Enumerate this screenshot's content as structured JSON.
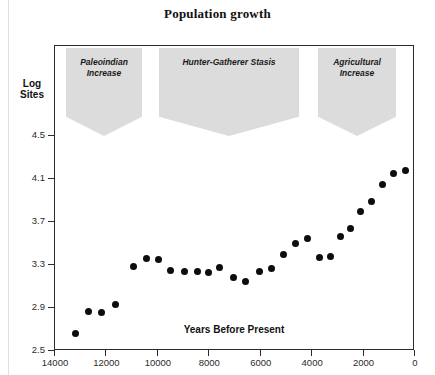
{
  "chart_data": {
    "type": "scatter",
    "title": "Population growth",
    "xlabel": "Years Before Present",
    "ylabel": "Log Sites",
    "xlim": [
      14000,
      0
    ],
    "ylim": [
      2.5,
      4.7
    ],
    "x_reversed": true,
    "grid": false,
    "legend": null,
    "xticks": [
      14000,
      12000,
      10000,
      8000,
      6000,
      4000,
      2000,
      0
    ],
    "xtick_labels": [
      "14000",
      "12000",
      "10000",
      "8000",
      "6000",
      "4000",
      "2000",
      "0"
    ],
    "yticks": [
      4.5,
      4.1,
      3.7,
      3.3,
      2.9,
      2.5
    ],
    "ytick_labels": [
      "4.5",
      "4.1",
      "3.7",
      "3.3",
      "2.9",
      "2.5"
    ],
    "marker": "filled-circle",
    "marker_color": "#0d0d0d",
    "points": [
      {
        "x": 13180,
        "y": 2.65
      },
      {
        "x": 12660,
        "y": 2.86
      },
      {
        "x": 12150,
        "y": 2.85
      },
      {
        "x": 11600,
        "y": 2.92
      },
      {
        "x": 10920,
        "y": 3.28
      },
      {
        "x": 10400,
        "y": 3.35
      },
      {
        "x": 9930,
        "y": 3.34
      },
      {
        "x": 9460,
        "y": 3.24
      },
      {
        "x": 8940,
        "y": 3.23
      },
      {
        "x": 8430,
        "y": 3.23
      },
      {
        "x": 7990,
        "y": 3.22
      },
      {
        "x": 7550,
        "y": 3.27
      },
      {
        "x": 7030,
        "y": 3.17
      },
      {
        "x": 6560,
        "y": 3.14
      },
      {
        "x": 6010,
        "y": 3.23
      },
      {
        "x": 5540,
        "y": 3.26
      },
      {
        "x": 5070,
        "y": 3.39
      },
      {
        "x": 4600,
        "y": 3.49
      },
      {
        "x": 4130,
        "y": 3.54
      },
      {
        "x": 3660,
        "y": 3.36
      },
      {
        "x": 3260,
        "y": 3.37
      },
      {
        "x": 2860,
        "y": 3.56
      },
      {
        "x": 2470,
        "y": 3.63
      },
      {
        "x": 2070,
        "y": 3.79
      },
      {
        "x": 1640,
        "y": 3.88
      },
      {
        "x": 1240,
        "y": 4.04
      },
      {
        "x": 800,
        "y": 4.14
      },
      {
        "x": 330,
        "y": 4.17
      }
    ],
    "annotations": [
      {
        "id": "paleoindian",
        "label": "Paleoindian\nIncrease",
        "line1": "Paleoindian",
        "line2": "Increase",
        "shape": "banner"
      },
      {
        "id": "hunter-gatherer",
        "label": "Hunter-Gatherer Stasis",
        "line1": "Hunter-Gatherer Stasis",
        "line2": "",
        "shape": "banner"
      },
      {
        "id": "agricultural",
        "label": "Agricultural\nIncrease",
        "line1": "Agricultural",
        "line2": "Increase",
        "shape": "banner"
      }
    ]
  },
  "colors": {
    "marker": "#0d0d0d",
    "banner": "#dcdcdc",
    "frame": "#2b2b2b",
    "background": "#ffffff"
  }
}
